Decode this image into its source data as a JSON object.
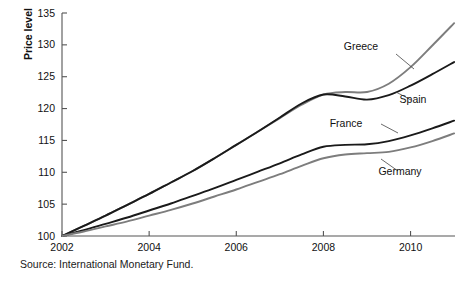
{
  "chart_data": {
    "type": "line",
    "title": "",
    "xlabel": "",
    "ylabel": "Price level",
    "xlim": [
      2002,
      2011.02
    ],
    "ylim": [
      100,
      135
    ],
    "xticks": [
      "2002",
      "2004",
      "2006",
      "2008",
      "2010"
    ],
    "xtick_values": [
      2002,
      2004,
      2006,
      2008,
      2010
    ],
    "yticks": [
      "100",
      "105",
      "110",
      "115",
      "120",
      "125",
      "130",
      "135"
    ],
    "ytick_values": [
      100,
      105,
      110,
      115,
      120,
      125,
      130,
      135
    ],
    "grid": false,
    "legend_position": "inline-annotations",
    "x": [
      2002,
      2002.5,
      2003,
      2003.5,
      2004,
      2004.5,
      2005,
      2005.5,
      2006,
      2006.5,
      2007,
      2007.5,
      2008,
      2008.5,
      2009,
      2009.5,
      2010,
      2010.5,
      2011
    ],
    "series": [
      {
        "name": "Greece",
        "color": "#7d7d7d",
        "values": [
          100.0,
          101.6,
          103.2,
          104.9,
          106.6,
          108.4,
          110.2,
          112.2,
          114.3,
          116.4,
          118.5,
          120.6,
          122.2,
          122.6,
          122.6,
          123.9,
          126.5,
          129.9,
          133.4
        ]
      },
      {
        "name": "Spain",
        "color": "#1a1a1a",
        "values": [
          100.0,
          101.6,
          103.2,
          104.9,
          106.6,
          108.4,
          110.2,
          112.2,
          114.3,
          116.4,
          118.6,
          120.8,
          122.2,
          121.9,
          121.4,
          122.1,
          123.6,
          125.4,
          127.3
        ]
      },
      {
        "name": "France",
        "color": "#1a1a1a",
        "values": [
          100.0,
          100.9,
          101.9,
          102.9,
          104.0,
          105.1,
          106.3,
          107.5,
          108.8,
          110.1,
          111.4,
          112.8,
          114.0,
          114.3,
          114.4,
          114.9,
          115.8,
          116.9,
          118.1
        ]
      },
      {
        "name": "Germany",
        "color": "#7d7d7d",
        "values": [
          100.0,
          100.7,
          101.5,
          102.3,
          103.2,
          104.1,
          105.1,
          106.2,
          107.3,
          108.5,
          109.7,
          111.0,
          112.2,
          112.8,
          113.0,
          113.2,
          113.9,
          114.9,
          116.1
        ]
      }
    ],
    "annotations": [
      {
        "label": "Greece",
        "x": 361,
        "y": 50,
        "leader": "M 396 54 L 414 69"
      },
      {
        "label": "Spain",
        "x": 413,
        "y": 103,
        "leader": "M 411 100 L 396 92"
      },
      {
        "label": "France",
        "x": 346,
        "y": 127,
        "leader": "M 381 124 L 398 133"
      },
      {
        "label": "Germany",
        "x": 400,
        "y": 175,
        "leader": "M 398 171 L 381 159"
      }
    ]
  },
  "source": {
    "note": "Source: International Monetary Fund."
  }
}
